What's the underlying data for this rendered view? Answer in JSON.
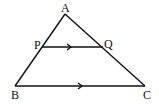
{
  "diagram": {
    "points": {
      "A": {
        "label": "A",
        "x": 65,
        "y": 13
      },
      "B": {
        "label": "B",
        "x": 15,
        "y": 86
      },
      "C": {
        "label": "C",
        "x": 145,
        "y": 86
      },
      "P": {
        "label": "P",
        "x": 42,
        "y": 47
      },
      "Q": {
        "label": "Q",
        "x": 103,
        "y": 47
      }
    },
    "segments": [
      "AB",
      "AC",
      "BC",
      "PQ"
    ],
    "parallel_marks": [
      "PQ",
      "BC"
    ],
    "colors": {
      "stroke": "#111111",
      "background": "#ffffff"
    }
  }
}
